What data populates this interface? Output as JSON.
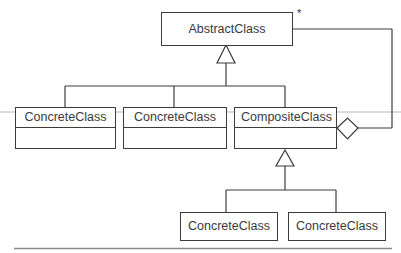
{
  "diagram": {
    "type": "uml-class-diagram",
    "pattern": "composite",
    "classes": [
      {
        "id": "abstract",
        "name": "AbstractClass"
      },
      {
        "id": "concrete1",
        "name": "ConcreteClass"
      },
      {
        "id": "concrete2",
        "name": "ConcreteClass"
      },
      {
        "id": "composite",
        "name": "CompositeClass"
      },
      {
        "id": "concrete3",
        "name": "ConcreteClass"
      },
      {
        "id": "concrete4",
        "name": "ConcreteClass"
      }
    ],
    "multiplicity": "*",
    "relations": [
      {
        "type": "generalization",
        "from": "concrete1",
        "to": "abstract"
      },
      {
        "type": "generalization",
        "from": "concrete2",
        "to": "abstract"
      },
      {
        "type": "generalization",
        "from": "composite",
        "to": "abstract"
      },
      {
        "type": "aggregation",
        "from": "composite",
        "to": "abstract",
        "multiplicity": "*"
      },
      {
        "type": "generalization",
        "from": "concrete3",
        "to": "composite"
      },
      {
        "type": "generalization",
        "from": "concrete4",
        "to": "composite"
      }
    ],
    "colors": {
      "line": "#3c3c3c",
      "rule": "#8a8a8a",
      "text": "#3a3a3a"
    }
  }
}
